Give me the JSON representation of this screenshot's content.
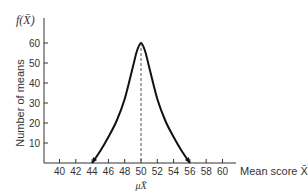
{
  "chart_data": {
    "type": "line",
    "title": "",
    "xlabel": "Mean score X̄",
    "ylabel": "Number of means",
    "y_function_label": "f(X̄)",
    "mean_label": "μX̄",
    "xlim": [
      38,
      62
    ],
    "ylim": [
      0,
      70
    ],
    "x_ticks": [
      40,
      42,
      44,
      46,
      48,
      50,
      52,
      54,
      56,
      58,
      60
    ],
    "y_ticks": [
      10,
      20,
      30,
      40,
      50,
      60
    ],
    "grid": false,
    "legend": null,
    "series": [
      {
        "name": "Sampling distribution of means",
        "x": [
          44,
          45,
          46,
          47,
          48,
          49,
          49.5,
          50,
          50.5,
          51,
          52,
          53,
          54,
          55,
          56
        ],
        "y": [
          0,
          6,
          13,
          21,
          32,
          48,
          56,
          60,
          56,
          48,
          32,
          21,
          13,
          6,
          0
        ]
      }
    ],
    "annotations": [
      {
        "type": "vertical-dashed-line",
        "x": 50,
        "label": "μX̄"
      },
      {
        "type": "arrowheads",
        "at": [
          44,
          56
        ]
      }
    ]
  },
  "labels": {
    "y_function": "f(X̄)",
    "y_axis": "Number of means",
    "x_axis": "Mean score X̄",
    "mean": "μX̄"
  }
}
